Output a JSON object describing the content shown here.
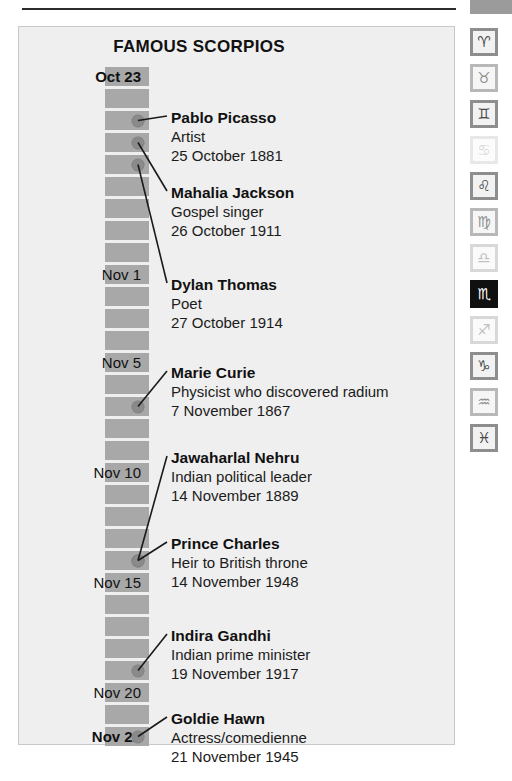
{
  "page": {
    "background": "#ffffff",
    "panel_bg": "#efefef",
    "panel_border": "#c9c9c9",
    "block_color": "#a8a8a8",
    "dot_color": "#8a8a8a",
    "accent": "#101010"
  },
  "panel": {
    "title": "FAMOUS SCORPIOS"
  },
  "timeline": {
    "block_count": 31,
    "start_label": "Oct 23",
    "end_label": "Nov 22",
    "date_labels": [
      {
        "text": "Oct 23",
        "bold": true,
        "block_index": 0
      },
      {
        "text": "Nov 1",
        "bold": false,
        "block_index": 9
      },
      {
        "text": "Nov 5",
        "bold": false,
        "block_index": 13
      },
      {
        "text": "Nov 10",
        "bold": false,
        "block_index": 18
      },
      {
        "text": "Nov 15",
        "bold": false,
        "block_index": 23
      },
      {
        "text": "Nov 20",
        "bold": false,
        "block_index": 28
      },
      {
        "text": "Nov 22",
        "bold": true,
        "block_index": 30
      }
    ]
  },
  "entries": [
    {
      "name": "Pablo Picasso",
      "role": "Artist",
      "date": "25 October 1881",
      "marker_block": 2,
      "text_top": 41
    },
    {
      "name": "Mahalia Jackson",
      "role": "Gospel singer",
      "date": "26 October 1911",
      "marker_block": 3,
      "text_top": 116
    },
    {
      "name": "Dylan Thomas",
      "role": "Poet",
      "date": "27 October 1914",
      "marker_block": 4,
      "text_top": 208
    },
    {
      "name": "Marie Curie",
      "role": "Physicist who discovered radium",
      "date": "7 November 1867",
      "marker_block": 15,
      "text_top": 296
    },
    {
      "name": "Jawaharlal Nehru",
      "role": "Indian political leader",
      "date": "14 November 1889",
      "marker_block": 22,
      "text_top": 381
    },
    {
      "name": "Prince Charles",
      "role": "Heir to British throne",
      "date": "14 November 1948",
      "marker_block": 22,
      "text_top": 467
    },
    {
      "name": "Indira Gandhi",
      "role": "Indian prime minister",
      "date": "19 November 1917",
      "marker_block": 27,
      "text_top": 559
    },
    {
      "name": "Goldie Hawn",
      "role": "Actress/comedienne",
      "date": "21 November 1945",
      "marker_block": 30,
      "text_top": 642
    }
  ],
  "zodiac_rail": [
    {
      "name": "aries-icon",
      "glyph": "♈",
      "state": "normal"
    },
    {
      "name": "taurus-icon",
      "glyph": "♉",
      "state": "dim1"
    },
    {
      "name": "gemini-icon",
      "glyph": "♊",
      "state": "normal"
    },
    {
      "name": "cancer-icon",
      "glyph": "♋",
      "state": "dim3"
    },
    {
      "name": "leo-icon",
      "glyph": "♌",
      "state": "normal"
    },
    {
      "name": "virgo-icon",
      "glyph": "♍",
      "state": "dim1"
    },
    {
      "name": "libra-icon",
      "glyph": "♎",
      "state": "dim2"
    },
    {
      "name": "scorpio-icon",
      "glyph": "♏",
      "state": "active"
    },
    {
      "name": "sagittarius-icon",
      "glyph": "♐",
      "state": "dim2"
    },
    {
      "name": "capricorn-icon",
      "glyph": "♑",
      "state": "normal"
    },
    {
      "name": "aquarius-icon",
      "glyph": "♒",
      "state": "dim1"
    },
    {
      "name": "pisces-icon",
      "glyph": "♓",
      "state": "normal"
    }
  ]
}
